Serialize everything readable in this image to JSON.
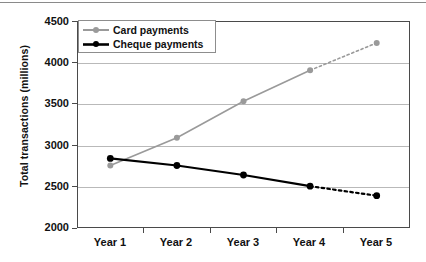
{
  "chart_data": {
    "type": "line",
    "title": "",
    "subtitle": "",
    "xlabel": "",
    "ylabel": "Total transactions (millions)",
    "categories": [
      "Year 1",
      "Year 2",
      "Year 3",
      "Year 4",
      "Year 5"
    ],
    "ylim": [
      2000,
      4500
    ],
    "yticks": [
      2000,
      2500,
      3000,
      3500,
      4000,
      4500
    ],
    "ytick_labels": [
      "2000",
      "2500",
      "3000",
      "3500",
      "4000",
      "4500"
    ],
    "grid": "horizontal",
    "legend_position": "top-left",
    "series": [
      {
        "name": "Card payments",
        "color": "#9a9a9a",
        "marker": "circle",
        "values": [
          2755,
          3090,
          3530,
          3905,
          4235
        ],
        "solid_through_index": 3,
        "dashed_from_index": 3,
        "note": "Year 4 to Year 5 segment is dotted (projected)"
      },
      {
        "name": "Cheque payments",
        "color": "#000000",
        "marker": "circle",
        "values": [
          2840,
          2755,
          2640,
          2505,
          2390
        ],
        "solid_through_index": 3,
        "dashed_from_index": 3,
        "note": "Year 4 to Year 5 segment is dotted (projected)"
      }
    ],
    "legend": [
      {
        "label": "Card payments",
        "color": "#9a9a9a"
      },
      {
        "label": "Cheque payments",
        "color": "#000000"
      }
    ]
  },
  "axes": {
    "y_title": "Total transactions (millions)",
    "y_tick_labels": [
      "4500",
      "4000",
      "3500",
      "3000",
      "2500",
      "2000"
    ],
    "x_tick_labels": [
      "Year 1",
      "Year 2",
      "Year 3",
      "Year 4",
      "Year 5"
    ]
  },
  "legend": {
    "items": [
      {
        "label": "Card payments"
      },
      {
        "label": "Cheque payments"
      }
    ]
  },
  "colors": {
    "card_series": "#9a9a9a",
    "cheque_series": "#000000",
    "gridline": "#b9b9b9",
    "frame": "#4a4a4a",
    "background": "#ffffff"
  }
}
